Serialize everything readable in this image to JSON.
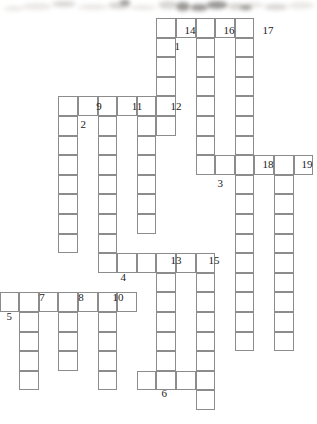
{
  "puzzle": {
    "title": "Crossword grid",
    "cell_size": 19.6,
    "grid_color": "#8c8c8c",
    "background_color": "#ffffff",
    "number_color": "#1b1b1b",
    "across_entries": [
      {
        "number": "1",
        "col": 9,
        "row": 1,
        "length": 5
      },
      {
        "number": "2",
        "col": 4,
        "row": 5,
        "length": 6
      },
      {
        "number": "3",
        "col": 11,
        "row": 8,
        "length": 6
      },
      {
        "number": "4",
        "col": 6,
        "row": 13,
        "length": 6
      },
      {
        "number": "5",
        "col": 1,
        "row": 15,
        "length": 7
      },
      {
        "number": "6",
        "col": 8,
        "row": 19,
        "length": 4
      }
    ],
    "down_entries": [
      {
        "number": "7",
        "col": 2,
        "row": 15,
        "length": 5
      },
      {
        "number": "8",
        "col": 4,
        "row": 15,
        "length": 4
      },
      {
        "number": "9",
        "col": 4,
        "row": 5,
        "length": 8
      },
      {
        "number": "10",
        "col": 6,
        "row": 15,
        "length": 5
      },
      {
        "number": "11",
        "col": 6,
        "row": 5,
        "length": 9
      },
      {
        "number": "12",
        "col": 8,
        "row": 5,
        "length": 7
      },
      {
        "number": "13",
        "col": 9,
        "row": 13,
        "length": 6
      },
      {
        "number": "14",
        "col": 9,
        "row": 1,
        "length": 6
      },
      {
        "number": "15",
        "col": 11,
        "row": 13,
        "length": 8
      },
      {
        "number": "16",
        "col": 11,
        "row": 1,
        "length": 8
      },
      {
        "number": "17",
        "col": 13,
        "row": 1,
        "length": 7
      },
      {
        "number": "18",
        "col": 13,
        "row": 8,
        "length": 10
      },
      {
        "number": "19",
        "col": 15,
        "row": 8,
        "length": 10
      }
    ],
    "labels": [
      {
        "text": "1",
        "x": 172,
        "y": 41,
        "align": "left"
      },
      {
        "text": "2",
        "x": 78,
        "y": 119,
        "align": "left"
      },
      {
        "text": "3",
        "x": 215,
        "y": 178,
        "align": "left"
      },
      {
        "text": "4",
        "x": 118,
        "y": 272,
        "align": "left"
      },
      {
        "text": "5",
        "x": 4,
        "y": 311,
        "align": "left"
      },
      {
        "text": "6",
        "x": 159,
        "y": 388,
        "align": "left"
      },
      {
        "text": "7",
        "x": 42,
        "y": 292,
        "align": "above"
      },
      {
        "text": "8",
        "x": 81,
        "y": 292,
        "align": "above"
      },
      {
        "text": "9",
        "x": 99,
        "y": 101,
        "align": "above"
      },
      {
        "text": "10",
        "x": 118,
        "y": 292,
        "align": "above"
      },
      {
        "text": "11",
        "x": 137,
        "y": 101,
        "align": "above"
      },
      {
        "text": "12",
        "x": 176,
        "y": 101,
        "align": "above"
      },
      {
        "text": "13",
        "x": 176,
        "y": 255,
        "align": "above"
      },
      {
        "text": "14",
        "x": 190,
        "y": 25,
        "align": "above"
      },
      {
        "text": "15",
        "x": 214,
        "y": 255,
        "align": "above"
      },
      {
        "text": "16",
        "x": 229,
        "y": 25,
        "align": "above"
      },
      {
        "text": "17",
        "x": 268,
        "y": 25,
        "align": "above"
      },
      {
        "text": "18",
        "x": 268,
        "y": 159,
        "align": "above"
      },
      {
        "text": "19",
        "x": 307,
        "y": 159,
        "align": "above"
      }
    ],
    "smudges": [
      {
        "x": 22,
        "y": 3,
        "w": 30,
        "h": 7,
        "tone": "light"
      },
      {
        "x": 52,
        "y": 1,
        "w": 24,
        "h": 6,
        "tone": ""
      },
      {
        "x": 78,
        "y": 4,
        "w": 30,
        "h": 6,
        "tone": "light"
      },
      {
        "x": 108,
        "y": 2,
        "w": 22,
        "h": 7,
        "tone": ""
      },
      {
        "x": 130,
        "y": 5,
        "w": 26,
        "h": 5,
        "tone": "light"
      },
      {
        "x": 158,
        "y": 1,
        "w": 20,
        "h": 8,
        "tone": ""
      },
      {
        "x": 176,
        "y": 2,
        "w": 14,
        "h": 9,
        "tone": "dark"
      },
      {
        "x": 190,
        "y": 4,
        "w": 18,
        "h": 7,
        "tone": "dark"
      },
      {
        "x": 206,
        "y": 1,
        "w": 22,
        "h": 8,
        "tone": "dark"
      },
      {
        "x": 228,
        "y": 3,
        "w": 16,
        "h": 7,
        "tone": ""
      },
      {
        "x": 244,
        "y": 2,
        "w": 20,
        "h": 6,
        "tone": "light"
      },
      {
        "x": 264,
        "y": 4,
        "w": 24,
        "h": 6,
        "tone": ""
      },
      {
        "x": 288,
        "y": 2,
        "w": 26,
        "h": 7,
        "tone": "light"
      },
      {
        "x": 4,
        "y": 6,
        "w": 20,
        "h": 5,
        "tone": "light"
      },
      {
        "x": 120,
        "y": 0,
        "w": 10,
        "h": 5,
        "tone": "dark"
      },
      {
        "x": 240,
        "y": 5,
        "w": 12,
        "h": 5,
        "tone": "dark"
      }
    ]
  }
}
